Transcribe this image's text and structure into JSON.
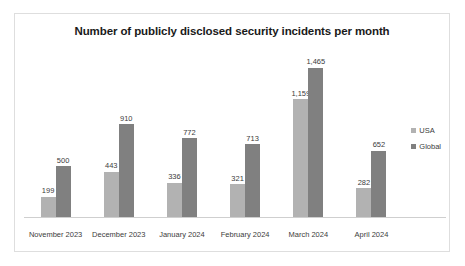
{
  "chart_data": {
    "type": "bar",
    "title": "Number of publicly disclosed security incidents per month",
    "xlabel": "",
    "ylabel": "",
    "ylim": [
      0,
      1700
    ],
    "grid": false,
    "legend_position": "right",
    "categories": [
      "November 2023",
      "December 2023",
      "January 2024",
      "February 2024",
      "March 2024",
      "April 2024"
    ],
    "series": [
      {
        "name": "USA",
        "color": "#b2b2b2",
        "values": [
          199,
          443,
          336,
          321,
          1159,
          282
        ],
        "labels": [
          "199",
          "443",
          "336",
          "321",
          "1,159",
          "282"
        ]
      },
      {
        "name": "Global",
        "color": "#808080",
        "values": [
          500,
          910,
          772,
          713,
          1465,
          652
        ],
        "labels": [
          "500",
          "910",
          "772",
          "713",
          "1,465",
          "652"
        ]
      }
    ]
  },
  "legend": {
    "items": [
      {
        "label": "USA",
        "color": "#b2b2b2"
      },
      {
        "label": "Global",
        "color": "#808080"
      }
    ]
  }
}
